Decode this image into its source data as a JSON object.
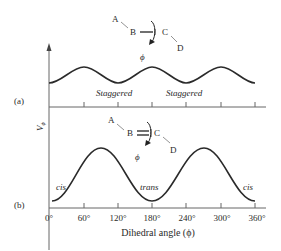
{
  "figure": {
    "panel_a": {
      "label": "(a)",
      "bond_diagram": {
        "atoms": [
          "A",
          "B",
          "C",
          "D"
        ],
        "bond": "single",
        "angle_symbol": "ϕ"
      },
      "annotations": [
        "Staggered",
        "Staggered"
      ]
    },
    "panel_b": {
      "label": "(b)",
      "bond_diagram": {
        "atoms": [
          "A",
          "B",
          "C",
          "D"
        ],
        "bond": "double",
        "angle_symbol": "ϕ"
      },
      "annotations": [
        "cis",
        "trans",
        "cis"
      ]
    },
    "y_label": "Vϕ",
    "x_label": "Dihedral angle (ϕ)",
    "x_ticks": [
      "0°",
      "60°",
      "120°",
      "180°",
      "240°",
      "300°",
      "360°"
    ]
  },
  "colors": {
    "line": "#2a2a2a",
    "axis": "#555555",
    "background": "#ffffff"
  }
}
